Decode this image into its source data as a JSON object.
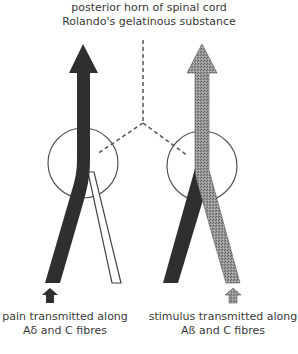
{
  "title": {
    "line1": "posterior horn of spinal cord",
    "line2": "Rolando's gelatinous substance"
  },
  "left_pathway": {
    "caption_line1": "pain transmitted along",
    "caption_line2": "Aδ and C fibres",
    "fill_color": "#2f2f2f",
    "branch_fill": "#ffffff"
  },
  "right_pathway": {
    "caption_line1": "stimulus transmitted along",
    "caption_line2": "Aß and C fibres",
    "fill_color": "#8a8a8a",
    "dark_fill": "#2f2f2f"
  },
  "colors": {
    "stroke": "#555555",
    "dashed_line": "#555555"
  }
}
